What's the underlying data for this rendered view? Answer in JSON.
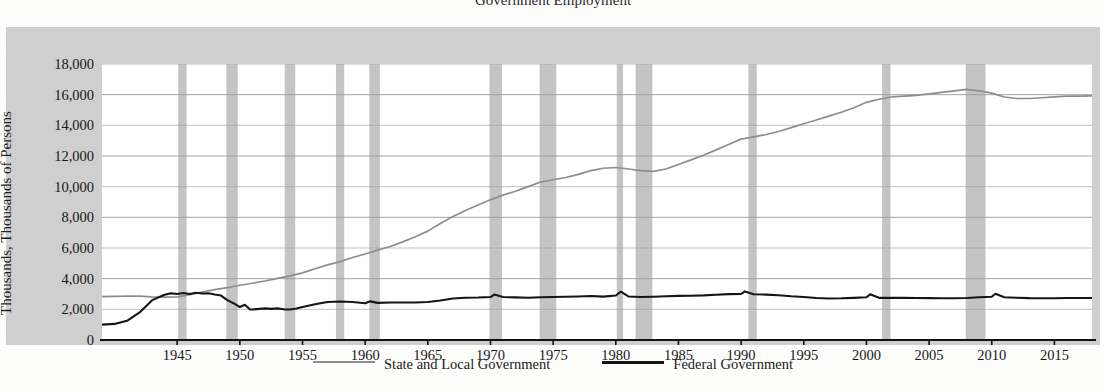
{
  "figure": {
    "title_remnant": "Government Employment",
    "ylabel": "Thousands, Thousands of Persons"
  },
  "legend": {
    "items": [
      {
        "label": "State and Local Government",
        "color": "#8d8d8d",
        "swatch": "state"
      },
      {
        "label": "Federal Government",
        "color": "#151515",
        "swatch": "federal"
      }
    ]
  },
  "axes": {
    "y_ticks": [
      "0",
      "2,000",
      "4,000",
      "6,000",
      "8,000",
      "10,000",
      "12,000",
      "14,000",
      "16,000",
      "18,000"
    ],
    "x_ticks": [
      "1945",
      "1950",
      "1955",
      "1960",
      "1965",
      "1970",
      "1975",
      "1980",
      "1985",
      "1990",
      "1995",
      "2000",
      "2005",
      "2010",
      "2015"
    ]
  },
  "chart_data": {
    "type": "line",
    "title": "Government Employment",
    "xlabel": "",
    "ylabel": "Thousands, Thousands of Persons",
    "xlim": [
      1939,
      2018
    ],
    "ylim": [
      0,
      18000
    ],
    "y_ticks": [
      0,
      2000,
      4000,
      6000,
      8000,
      10000,
      12000,
      14000,
      16000,
      18000
    ],
    "x_ticks": [
      1945,
      1950,
      1955,
      1960,
      1965,
      1970,
      1975,
      1980,
      1985,
      1990,
      1995,
      2000,
      2005,
      2010,
      2015
    ],
    "grid": "horizontal",
    "legend_position": "bottom-center",
    "colors": {
      "state_local": "#8d8d8d",
      "federal": "#151515",
      "recession_band": "#c4c4c4",
      "panel": "#cfcfcf"
    },
    "annotations": [
      "Gray vertical bands mark NBER recessions",
      "Small spikes in the Federal series at 1950, 1960, 1970, 1980, 1990, 2000 and 2010 are decennial Census temporary hiring"
    ],
    "recessions": [
      {
        "start": 1945.08,
        "end": 1945.75
      },
      {
        "start": 1948.92,
        "end": 1949.83
      },
      {
        "start": 1953.58,
        "end": 1954.42
      },
      {
        "start": 1957.67,
        "end": 1958.33
      },
      {
        "start": 1960.33,
        "end": 1961.17
      },
      {
        "start": 1969.92,
        "end": 1970.92
      },
      {
        "start": 1973.92,
        "end": 1975.25
      },
      {
        "start": 1980.08,
        "end": 1980.58
      },
      {
        "start": 1981.58,
        "end": 1982.92
      },
      {
        "start": 1990.58,
        "end": 1991.25
      },
      {
        "start": 2001.25,
        "end": 2001.92
      },
      {
        "start": 2007.92,
        "end": 2009.5
      }
    ],
    "series": [
      {
        "name": "State and Local Government",
        "color": "#8d8d8d",
        "points": [
          [
            1939,
            2830
          ],
          [
            1940,
            2850
          ],
          [
            1941,
            2870
          ],
          [
            1942,
            2860
          ],
          [
            1943,
            2810
          ],
          [
            1944,
            2790
          ],
          [
            1945,
            2810
          ],
          [
            1946,
            2950
          ],
          [
            1947,
            3130
          ],
          [
            1948,
            3280
          ],
          [
            1949,
            3410
          ],
          [
            1950,
            3570
          ],
          [
            1951,
            3700
          ],
          [
            1952,
            3850
          ],
          [
            1953,
            4020
          ],
          [
            1954,
            4180
          ],
          [
            1955,
            4380
          ],
          [
            1956,
            4650
          ],
          [
            1957,
            4900
          ],
          [
            1958,
            5110
          ],
          [
            1959,
            5380
          ],
          [
            1960,
            5610
          ],
          [
            1961,
            5860
          ],
          [
            1962,
            6100
          ],
          [
            1963,
            6400
          ],
          [
            1964,
            6730
          ],
          [
            1965,
            7100
          ],
          [
            1966,
            7600
          ],
          [
            1967,
            8050
          ],
          [
            1968,
            8450
          ],
          [
            1969,
            8800
          ],
          [
            1970,
            9150
          ],
          [
            1971,
            9450
          ],
          [
            1972,
            9700
          ],
          [
            1973,
            10000
          ],
          [
            1974,
            10300
          ],
          [
            1975,
            10450
          ],
          [
            1976,
            10600
          ],
          [
            1977,
            10800
          ],
          [
            1978,
            11050
          ],
          [
            1979,
            11200
          ],
          [
            1980,
            11250
          ],
          [
            1981,
            11150
          ],
          [
            1982,
            11050
          ],
          [
            1983,
            11000
          ],
          [
            1984,
            11150
          ],
          [
            1985,
            11450
          ],
          [
            1986,
            11750
          ],
          [
            1987,
            12050
          ],
          [
            1988,
            12400
          ],
          [
            1989,
            12750
          ],
          [
            1990,
            13100
          ],
          [
            1991,
            13250
          ],
          [
            1992,
            13400
          ],
          [
            1993,
            13600
          ],
          [
            1994,
            13850
          ],
          [
            1995,
            14100
          ],
          [
            1996,
            14350
          ],
          [
            1997,
            14600
          ],
          [
            1998,
            14850
          ],
          [
            1999,
            15150
          ],
          [
            2000,
            15500
          ],
          [
            2001,
            15700
          ],
          [
            2002,
            15850
          ],
          [
            2003,
            15900
          ],
          [
            2004,
            15950
          ],
          [
            2005,
            16050
          ],
          [
            2006,
            16150
          ],
          [
            2007,
            16250
          ],
          [
            2008,
            16350
          ],
          [
            2009,
            16250
          ],
          [
            2010,
            16100
          ],
          [
            2011,
            15850
          ],
          [
            2012,
            15750
          ],
          [
            2013,
            15750
          ],
          [
            2014,
            15800
          ],
          [
            2015,
            15850
          ],
          [
            2016,
            15900
          ],
          [
            2017,
            15900
          ],
          [
            2018,
            15920
          ]
        ]
      },
      {
        "name": "Federal Government",
        "color": "#151515",
        "points": [
          [
            1939,
            1000
          ],
          [
            1940,
            1050
          ],
          [
            1941,
            1250
          ],
          [
            1942,
            1800
          ],
          [
            1943,
            2600
          ],
          [
            1944,
            2950
          ],
          [
            1944.5,
            3050
          ],
          [
            1945,
            3000
          ],
          [
            1945.5,
            3060
          ],
          [
            1946,
            3000
          ],
          [
            1946.5,
            3080
          ],
          [
            1947,
            3030
          ],
          [
            1947.5,
            3050
          ],
          [
            1948,
            2970
          ],
          [
            1948.5,
            2900
          ],
          [
            1949,
            2600
          ],
          [
            1949.5,
            2400
          ],
          [
            1950,
            2150
          ],
          [
            1950.4,
            2300
          ],
          [
            1950.8,
            2000
          ],
          [
            1951,
            1990
          ],
          [
            1952,
            2060
          ],
          [
            1952.5,
            2030
          ],
          [
            1953,
            2060
          ],
          [
            1953.5,
            2000
          ],
          [
            1954,
            1990
          ],
          [
            1954.5,
            2060
          ],
          [
            1955,
            2150
          ],
          [
            1956,
            2330
          ],
          [
            1957,
            2480
          ],
          [
            1958,
            2510
          ],
          [
            1959,
            2480
          ],
          [
            1960,
            2400
          ],
          [
            1960.4,
            2520
          ],
          [
            1961,
            2420
          ],
          [
            1962,
            2450
          ],
          [
            1963,
            2450
          ],
          [
            1964,
            2450
          ],
          [
            1965,
            2480
          ],
          [
            1966,
            2580
          ],
          [
            1967,
            2710
          ],
          [
            1968,
            2760
          ],
          [
            1969,
            2770
          ],
          [
            1970,
            2800
          ],
          [
            1970.3,
            2960
          ],
          [
            1971,
            2800
          ],
          [
            1972,
            2780
          ],
          [
            1973,
            2760
          ],
          [
            1974,
            2790
          ],
          [
            1975,
            2800
          ],
          [
            1976,
            2820
          ],
          [
            1977,
            2840
          ],
          [
            1978,
            2870
          ],
          [
            1979,
            2830
          ],
          [
            1980,
            2900
          ],
          [
            1980.4,
            3150
          ],
          [
            1981,
            2840
          ],
          [
            1982,
            2800
          ],
          [
            1983,
            2820
          ],
          [
            1984,
            2850
          ],
          [
            1985,
            2880
          ],
          [
            1986,
            2890
          ],
          [
            1987,
            2910
          ],
          [
            1988,
            2950
          ],
          [
            1989,
            2990
          ],
          [
            1990,
            3000
          ],
          [
            1990.3,
            3170
          ],
          [
            1991,
            2980
          ],
          [
            1992,
            2960
          ],
          [
            1993,
            2920
          ],
          [
            1994,
            2850
          ],
          [
            1995,
            2800
          ],
          [
            1996,
            2740
          ],
          [
            1997,
            2710
          ],
          [
            1998,
            2720
          ],
          [
            1999,
            2750
          ],
          [
            2000,
            2790
          ],
          [
            2000.3,
            2980
          ],
          [
            2001,
            2750
          ],
          [
            2002,
            2750
          ],
          [
            2003,
            2760
          ],
          [
            2004,
            2740
          ],
          [
            2005,
            2730
          ],
          [
            2006,
            2720
          ],
          [
            2007,
            2720
          ],
          [
            2008,
            2740
          ],
          [
            2009,
            2790
          ],
          [
            2010,
            2820
          ],
          [
            2010.3,
            3020
          ],
          [
            2011,
            2790
          ],
          [
            2012,
            2760
          ],
          [
            2013,
            2730
          ],
          [
            2014,
            2720
          ],
          [
            2015,
            2720
          ],
          [
            2016,
            2740
          ],
          [
            2017,
            2740
          ],
          [
            2018,
            2740
          ]
        ]
      }
    ]
  }
}
